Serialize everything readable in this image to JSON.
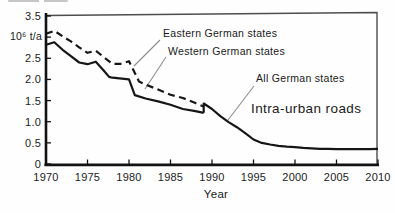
{
  "chart_data": {
    "type": "line",
    "title": "",
    "xlabel": "Year",
    "ylabel": "10⁶ t/a",
    "xlim": [
      1970,
      2010
    ],
    "ylim": [
      0,
      3.5
    ],
    "grid": false,
    "legend_position": "inline-annotations",
    "x_ticks": [
      1970,
      1975,
      1980,
      1985,
      1990,
      1995,
      2000,
      2005,
      2010
    ],
    "x_tick_labels": [
      "1970",
      "1975",
      "1980",
      "1985",
      "1990",
      "1995",
      "2000",
      "2005",
      "2010"
    ],
    "y_ticks": [
      0,
      0.5,
      1.0,
      1.5,
      2.0,
      2.5,
      3.0,
      3.5
    ],
    "y_tick_labels": [
      "0",
      "0.5",
      "1.0",
      "1.5",
      "2.0",
      "2.5",
      "",
      "3.5"
    ],
    "series": [
      {
        "name": "Eastern German states",
        "style": "dashed",
        "color": "#161616",
        "points": [
          [
            1970,
            3.08
          ],
          [
            1971,
            3.15
          ],
          [
            1972,
            3.02
          ],
          [
            1973,
            2.9
          ],
          [
            1974,
            2.76
          ],
          [
            1975,
            2.63
          ],
          [
            1976,
            2.68
          ],
          [
            1977,
            2.52
          ],
          [
            1978,
            2.37
          ],
          [
            1979,
            2.37
          ],
          [
            1980,
            2.43
          ],
          [
            1981.2,
            1.95
          ],
          [
            1982,
            1.88
          ],
          [
            1983.5,
            1.76
          ],
          [
            1985,
            1.64
          ],
          [
            1986.5,
            1.56
          ],
          [
            1988,
            1.44
          ],
          [
            1989,
            1.36
          ]
        ]
      },
      {
        "name": "Western German states",
        "style": "solid",
        "color": "#161616",
        "points": [
          [
            1970,
            2.82
          ],
          [
            1971,
            2.88
          ],
          [
            1972,
            2.7
          ],
          [
            1973,
            2.55
          ],
          [
            1974,
            2.4
          ],
          [
            1975,
            2.36
          ],
          [
            1976,
            2.42
          ],
          [
            1977,
            2.2
          ],
          [
            1977.6,
            2.06
          ],
          [
            1978,
            2.04
          ],
          [
            1980,
            2.0
          ],
          [
            1980.7,
            1.63
          ],
          [
            1982,
            1.55
          ],
          [
            1983.5,
            1.48
          ],
          [
            1985,
            1.4
          ],
          [
            1986.5,
            1.3
          ],
          [
            1988,
            1.25
          ],
          [
            1989,
            1.21
          ]
        ]
      },
      {
        "name": "All German states",
        "style": "solid",
        "color": "#161616",
        "points": [
          [
            1989,
            1.21
          ],
          [
            1989,
            1.43
          ],
          [
            1990,
            1.3
          ],
          [
            1991,
            1.13
          ],
          [
            1992,
            0.99
          ],
          [
            1993,
            0.87
          ],
          [
            1994,
            0.73
          ],
          [
            1995,
            0.58
          ],
          [
            1996,
            0.5
          ],
          [
            1997,
            0.46
          ],
          [
            1998,
            0.43
          ],
          [
            1999,
            0.41
          ],
          [
            2000,
            0.4
          ],
          [
            2001,
            0.38
          ],
          [
            2002,
            0.37
          ],
          [
            2003,
            0.36
          ],
          [
            2004,
            0.36
          ],
          [
            2005,
            0.35
          ],
          [
            2006,
            0.35
          ],
          [
            2007,
            0.35
          ],
          [
            2008,
            0.35
          ],
          [
            2009,
            0.35
          ],
          [
            2010,
            0.36
          ]
        ]
      }
    ],
    "annotations": [
      {
        "label": "Eastern German states",
        "pointer": [
          160,
          40,
          134,
          66
        ]
      },
      {
        "label": "Western German states",
        "pointer": [
          166,
          57,
          145,
          89
        ]
      },
      {
        "label": "All German states",
        "pointer": [
          254,
          86,
          228,
          120
        ]
      },
      {
        "label": "Intra-urban roads",
        "pointer": null
      }
    ]
  }
}
